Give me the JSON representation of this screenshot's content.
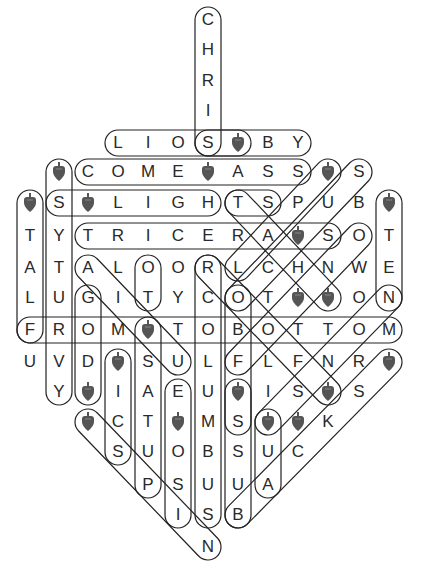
{
  "puzzle": {
    "title": "Dreidel Word Search",
    "col_x": [
      30,
      59,
      88,
      118,
      148,
      178,
      208,
      238,
      268,
      298,
      328,
      359,
      389
    ],
    "row_y": [
      20,
      50,
      81,
      111,
      143,
      172,
      203,
      236,
      268,
      298,
      330,
      362,
      392,
      422,
      452,
      485,
      515,
      547
    ],
    "dreidel_symbol": "*",
    "colors": {
      "letter": "#2a2a2a",
      "loop": "#222222",
      "dreidel": "#555555"
    },
    "rows": [
      [
        "",
        "",
        "",
        "",
        "",
        "",
        "C",
        "",
        "",
        "",
        "",
        "",
        ""
      ],
      [
        "",
        "",
        "",
        "",
        "",
        "",
        "H",
        "",
        "",
        "",
        "",
        "",
        ""
      ],
      [
        "",
        "",
        "",
        "",
        "",
        "",
        "R",
        "",
        "",
        "",
        "",
        "",
        ""
      ],
      [
        "",
        "",
        "",
        "",
        "",
        "",
        "I",
        "",
        "",
        "",
        "",
        "",
        ""
      ],
      [
        "",
        "",
        "",
        "L",
        "I",
        "O",
        "S",
        "*",
        "B",
        "Y",
        "",
        "",
        ""
      ],
      [
        "",
        "*",
        "C",
        "O",
        "M",
        "E",
        "*",
        "A",
        "S",
        "S",
        "*",
        "S",
        ""
      ],
      [
        "*",
        "S",
        "*",
        "L",
        "I",
        "G",
        "H",
        "T",
        "S",
        "P",
        "U",
        "B",
        "*"
      ],
      [
        "T",
        "Y",
        "T",
        "R",
        "I",
        "C",
        "E",
        "R",
        "A",
        "*",
        "S",
        "O",
        "T"
      ],
      [
        "A",
        "T",
        "A",
        "L",
        "O",
        "O",
        "R",
        "L",
        "C",
        "H",
        "N",
        "W",
        "E"
      ],
      [
        "L",
        "U",
        "G",
        "I",
        "T",
        "Y",
        "C",
        "O",
        "T",
        "*",
        "*",
        "O",
        "N"
      ],
      [
        "F",
        "R",
        "O",
        "M",
        "*",
        "T",
        "O",
        "B",
        "O",
        "T",
        "T",
        "O",
        "M"
      ],
      [
        "U",
        "V",
        "D",
        "*",
        "S",
        "U",
        "L",
        "F",
        "L",
        "F",
        "N",
        "R",
        "*"
      ],
      [
        "",
        "Y",
        "*",
        "I",
        "A",
        "E",
        "U",
        "*",
        "I",
        "S",
        "*",
        "S",
        ""
      ],
      [
        "",
        "",
        "*",
        "C",
        "T",
        "*",
        "M",
        "S",
        "*",
        "*",
        "K",
        "",
        ""
      ],
      [
        "",
        "",
        "",
        "S",
        "U",
        "O",
        "B",
        "S",
        "U",
        "C",
        "",
        "",
        ""
      ],
      [
        "",
        "",
        "",
        "",
        "P",
        "S",
        "U",
        "U",
        "A",
        "",
        "",
        "",
        ""
      ],
      [
        "",
        "",
        "",
        "",
        "",
        "I",
        "S",
        "B",
        "",
        "",
        "",
        "",
        ""
      ],
      [
        "",
        "",
        "",
        "",
        "",
        "",
        "N",
        "",
        "",
        "",
        "",
        "",
        ""
      ]
    ],
    "loops": [
      {
        "from": [
          6,
          0
        ],
        "to": [
          6,
          4
        ]
      },
      {
        "from": [
          3,
          4
        ],
        "to": [
          9,
          4
        ]
      },
      {
        "from": [
          6,
          4
        ],
        "to": [
          7,
          4
        ]
      },
      {
        "from": [
          2,
          5
        ],
        "to": [
          9,
          5
        ]
      },
      {
        "from": [
          1,
          6
        ],
        "to": [
          6,
          6
        ]
      },
      {
        "from": [
          7,
          6
        ],
        "to": [
          8,
          6
        ]
      },
      {
        "from": [
          2,
          7
        ],
        "to": [
          10,
          7
        ]
      },
      {
        "from": [
          0,
          10
        ],
        "to": [
          12,
          10
        ]
      },
      {
        "from": [
          0,
          6
        ],
        "to": [
          0,
          10
        ]
      },
      {
        "from": [
          1,
          5
        ],
        "to": [
          1,
          12
        ]
      },
      {
        "from": [
          2,
          9
        ],
        "to": [
          2,
          12
        ]
      },
      {
        "from": [
          3,
          11
        ],
        "to": [
          3,
          14
        ]
      },
      {
        "from": [
          4,
          8
        ],
        "to": [
          4,
          9
        ]
      },
      {
        "from": [
          4,
          10
        ],
        "to": [
          4,
          15
        ]
      },
      {
        "from": [
          5,
          12
        ],
        "to": [
          5,
          16
        ]
      },
      {
        "from": [
          6,
          8
        ],
        "to": [
          6,
          16
        ]
      },
      {
        "from": [
          7,
          12
        ],
        "to": [
          7,
          16
        ]
      },
      {
        "from": [
          7,
          9
        ],
        "to": [
          7,
          13
        ]
      },
      {
        "from": [
          8,
          13
        ],
        "to": [
          8,
          15
        ]
      },
      {
        "from": [
          12,
          6
        ],
        "to": [
          12,
          9
        ]
      },
      {
        "from": [
          2,
          8
        ],
        "to": [
          5,
          11
        ]
      },
      {
        "from": [
          2,
          13
        ],
        "to": [
          6,
          17
        ]
      },
      {
        "from": [
          6,
          8
        ],
        "to": [
          10,
          12
        ]
      },
      {
        "from": [
          7,
          6
        ],
        "to": [
          10,
          9
        ]
      },
      {
        "from": [
          7,
          8
        ],
        "to": [
          10,
          5
        ]
      },
      {
        "from": [
          7,
          9
        ],
        "to": [
          11,
          5
        ]
      },
      {
        "from": [
          7,
          11
        ],
        "to": [
          11,
          7
        ]
      },
      {
        "from": [
          8,
          13
        ],
        "to": [
          12,
          9
        ]
      },
      {
        "from": [
          7,
          16
        ],
        "to": [
          12,
          11
        ]
      }
    ]
  }
}
